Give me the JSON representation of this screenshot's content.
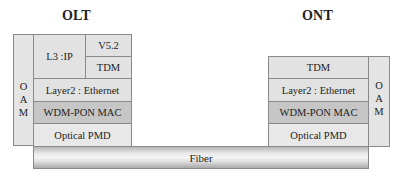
{
  "olt": {
    "title": "OLT",
    "oam": [
      "O",
      "A",
      "M"
    ],
    "layers": {
      "l3": "L3 :IP",
      "v52": "V5.2",
      "tdm": "TDM",
      "layer2": "Layer2 : Ethernet",
      "mac": "WDM-PON MAC",
      "pmd": "Optical PMD"
    }
  },
  "ont": {
    "title": "ONT",
    "oam": [
      "O",
      "A",
      "M"
    ],
    "layers": {
      "tdm": "TDM",
      "layer2": "Layer2 : Ethernet",
      "mac": "WDM-PON MAC",
      "pmd": "Optical PMD"
    }
  },
  "fiber": {
    "label": "Fiber"
  },
  "colors": {
    "cell": "#e2e2e2",
    "mac_cell": "#c6c6c6",
    "border": "#8a8a8a"
  }
}
